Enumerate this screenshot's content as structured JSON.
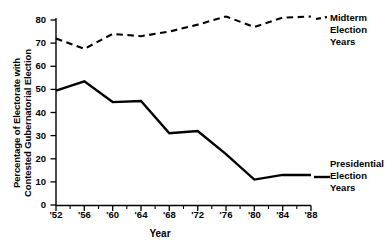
{
  "chart_data": {
    "type": "line",
    "title": "",
    "xlabel": "Year",
    "ylabel_lines": [
      "Percentage of Electorate with",
      "Contested Gubernatorial Election"
    ],
    "ylabel": "Percentage of Electorate with Contested Gubernatorial Election",
    "x_tick_labels": [
      "'52",
      "'56",
      "'60",
      "'64",
      "'68",
      "'72",
      "'76",
      "'80",
      "'84",
      "'88"
    ],
    "x_tick_values": [
      1952,
      1956,
      1960,
      1964,
      1968,
      1972,
      1976,
      1980,
      1984,
      1988
    ],
    "y_tick_labels": [
      "0",
      "10",
      "20",
      "30",
      "40",
      "50",
      "60",
      "70",
      "80"
    ],
    "y_tick_values": [
      0,
      10,
      20,
      30,
      40,
      50,
      60,
      70,
      80
    ],
    "xlim": [
      1952,
      1988
    ],
    "ylim": [
      0,
      80
    ],
    "grid": false,
    "legend_position": "right-inline",
    "series": [
      {
        "name": "Midterm Election Years",
        "style": "dashed",
        "color": "#000000",
        "x": [
          1952,
          1956,
          1960,
          1964,
          1968,
          1972,
          1976,
          1980,
          1984,
          1988
        ],
        "values": [
          72,
          67.5,
          74,
          73,
          75,
          78,
          81.5,
          77,
          81,
          81.5
        ]
      },
      {
        "name": "Presidential Election Years",
        "style": "solid",
        "color": "#000000",
        "x": [
          1952,
          1956,
          1960,
          1964,
          1968,
          1972,
          1976,
          1980,
          1984,
          1988
        ],
        "values": [
          49.5,
          53.5,
          44.5,
          45,
          31,
          32,
          22,
          11,
          13,
          13
        ]
      }
    ]
  },
  "legend": {
    "midterm": [
      "Midterm",
      "Election",
      "Years"
    ],
    "presidential": [
      "Presidential",
      "Election",
      "Years"
    ]
  },
  "axes": {
    "y_axis_name": "y-axis",
    "x_axis_name": "x-axis"
  }
}
